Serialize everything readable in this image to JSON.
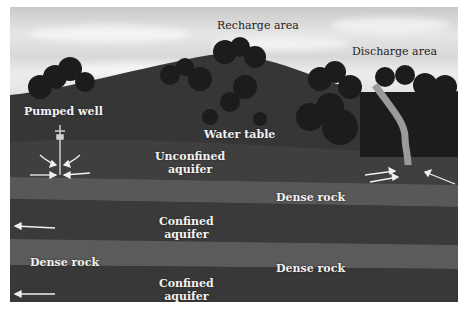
{
  "diagram": {
    "labels": {
      "recharge_area": "Recharge area",
      "discharge_area": "Discharge area",
      "pumped_well": "Pumped well",
      "water_table": "Water table",
      "unconfined_aquifer_1": "Unconfined",
      "unconfined_aquifer_2": "aquifer",
      "dense_rock_upper": "Dense rock",
      "confined_aquifer_upper_1": "Confined",
      "confined_aquifer_upper_2": "aquifer",
      "dense_rock_left": "Dense rock",
      "dense_rock_right": "Dense rock",
      "confined_aquifer_lower_1": "Confined",
      "confined_aquifer_lower_2": "aquifer"
    },
    "colors": {
      "sky": "#dcdcdc",
      "hill": "#3a3a3a",
      "trees": "#1e1e1e",
      "aquifer": "#3b3b3b",
      "dense_rock": "#5a5a5a",
      "stream": "#9a9a9a",
      "arrows": "#f0f0f0"
    }
  }
}
